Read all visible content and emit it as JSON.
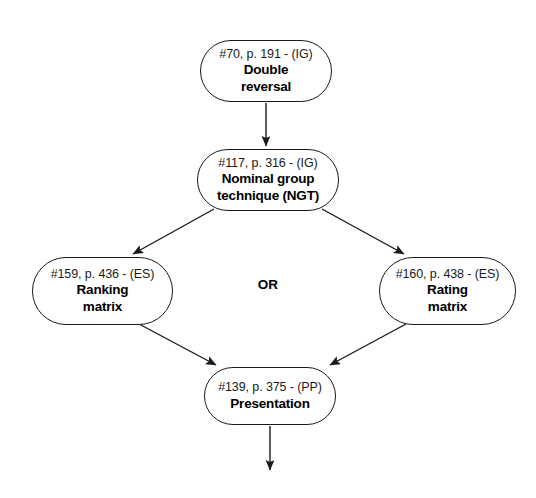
{
  "diagram": {
    "type": "flowchart",
    "background_color": "#ffffff",
    "line_color": "#1a1a1a",
    "text_color": "#000000",
    "nodes": [
      {
        "key": "double-reversal",
        "id_text": "#70, p. 191 - (IG)",
        "label_lines": [
          "Double",
          "reversal"
        ],
        "shape": "stadium"
      },
      {
        "key": "ngt",
        "id_text": "#117, p. 316 - (IG)",
        "label_lines": [
          "Nominal group",
          "technique (NGT)"
        ],
        "shape": "stadium"
      },
      {
        "key": "ranking-matrix",
        "id_text": "#159, p. 436 - (ES)",
        "label_lines": [
          "Ranking",
          "matrix"
        ],
        "shape": "stadium"
      },
      {
        "key": "rating-matrix",
        "id_text": "#160, p. 438 - (ES)",
        "label_lines": [
          "Rating",
          "matrix"
        ],
        "shape": "stadium"
      },
      {
        "key": "presentation",
        "id_text": "#139, p. 375 - (PP)",
        "label_lines": [
          "Presentation"
        ],
        "shape": "stadium"
      }
    ],
    "center_label": "OR",
    "edges": [
      {
        "name": "double-reversal-to-ngt",
        "from": "double-reversal",
        "to": "ngt",
        "style": "vertical-arrow"
      },
      {
        "name": "ngt-to-ranking-matrix",
        "from": "ngt",
        "to": "ranking-matrix",
        "style": "diagonal-arrow"
      },
      {
        "name": "ngt-to-rating-matrix",
        "from": "ngt",
        "to": "rating-matrix",
        "style": "diagonal-arrow"
      },
      {
        "name": "ranking-matrix-to-presentation",
        "from": "ranking-matrix",
        "to": "presentation",
        "style": "diagonal-arrow"
      },
      {
        "name": "rating-matrix-to-presentation",
        "from": "rating-matrix",
        "to": "presentation",
        "style": "diagonal-arrow"
      },
      {
        "name": "presentation-to-next",
        "from": "presentation",
        "to": null,
        "style": "vertical-arrow"
      }
    ]
  }
}
